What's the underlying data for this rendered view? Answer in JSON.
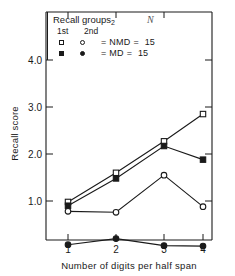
{
  "chart_data": {
    "type": "line",
    "title": "",
    "xlabel": "Number of digits per half span",
    "ylabel": "Recall score",
    "x": [
      1,
      2,
      3,
      4
    ],
    "xtick_labels": [
      "1",
      "2",
      "3",
      "4"
    ],
    "ytick_labels": [
      "1.0",
      "2.0",
      "3.0",
      "4.0"
    ],
    "ytick_values": [
      1.0,
      2.0,
      3.0,
      4.0
    ],
    "ylim": [
      0,
      4.6
    ],
    "xlim": [
      0.55,
      4.55
    ],
    "grid": false,
    "legend_position": "top-left-inside",
    "series": [
      {
        "name": "NMD 1st recall",
        "marker": "open-square",
        "values": [
          0.98,
          1.6,
          2.27,
          2.85
        ]
      },
      {
        "name": "MD 1st recall",
        "marker": "filled-square",
        "values": [
          0.9,
          1.48,
          2.17,
          1.88
        ]
      },
      {
        "name": "NMD 2nd recall",
        "marker": "open-circle",
        "values": [
          0.78,
          0.76,
          1.55,
          0.88
        ]
      },
      {
        "name": "MD 2nd recall",
        "marker": "filled-circle",
        "values": [
          0.07,
          0.2,
          0.05,
          0.04
        ]
      }
    ]
  },
  "legend": {
    "header_text": "Recall  groups",
    "header_subscript": "2",
    "header_n": "N",
    "col1_head": "1st",
    "col2_head": "2nd",
    "rows": [
      {
        "sym1": "open-square",
        "sym2": "open-circle",
        "eq1": "=",
        "name": "NMD",
        "eq2": "=",
        "n": "15"
      },
      {
        "sym1": "filled-square",
        "sym2": "filled-circle",
        "eq1": "=",
        "name": "MD",
        "eq2": "=",
        "n": "15"
      }
    ]
  },
  "axes": {
    "y_title": "Recall score",
    "x_title": "Number of digits per half span",
    "ytick_0": "1.0",
    "ytick_1": "2.0",
    "ytick_2": "3.0",
    "ytick_3": "4.0",
    "xtick_0": "1",
    "xtick_1": "2",
    "xtick_2": "3",
    "xtick_3": "4"
  },
  "colors": {
    "ink": "#1a1a1a",
    "background": "#ffffff"
  }
}
